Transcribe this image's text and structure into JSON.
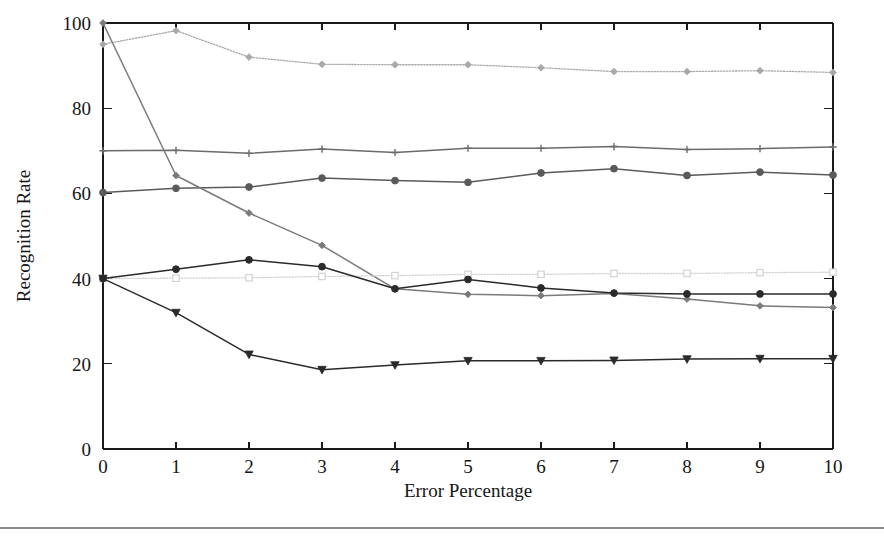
{
  "figure": {
    "background_color": "#ffffff",
    "footer_rule_color": "#8b8b8b"
  },
  "axes": {
    "x_title": "Error Percentage",
    "y_title": "Recognition Rate",
    "x_ticks": [
      "0",
      "1",
      "2",
      "3",
      "4",
      "5",
      "6",
      "7",
      "8",
      "9",
      "10"
    ],
    "y_ticks": [
      "0",
      "20",
      "40",
      "60",
      "80",
      "100"
    ]
  },
  "chart_data": {
    "type": "line",
    "title": "",
    "xlabel": "Error Percentage",
    "ylabel": "Recognition Rate",
    "xlim": [
      0,
      10
    ],
    "ylim": [
      0,
      100
    ],
    "x": [
      0,
      1,
      2,
      3,
      4,
      5,
      6,
      7,
      8,
      9,
      10
    ],
    "grid": false,
    "legend_position": "none",
    "series": [
      {
        "name": "series-top-dotted-diamond",
        "marker": "diamond",
        "color": "#a8a8a8",
        "linestyle": "dotted",
        "values": [
          95.0,
          98.2,
          92.0,
          90.3,
          90.2,
          90.2,
          89.5,
          88.6,
          88.6,
          88.8,
          88.4
        ]
      },
      {
        "name": "series-flat-70-plus",
        "marker": "plus",
        "color": "#6b6b6b",
        "linestyle": "solid",
        "values": [
          70.0,
          70.1,
          69.4,
          70.4,
          69.6,
          70.6,
          70.6,
          71.0,
          70.3,
          70.5,
          70.9
        ]
      },
      {
        "name": "series-rising-60-circle",
        "marker": "circle",
        "color": "#5a5a5a",
        "linestyle": "solid",
        "values": [
          60.2,
          61.2,
          61.5,
          63.6,
          63.0,
          62.6,
          64.8,
          65.8,
          64.2,
          65.0,
          64.3
        ]
      },
      {
        "name": "series-steep-decline-diamond",
        "marker": "diamond",
        "color": "#7a7a7a",
        "linestyle": "solid",
        "values": [
          100.0,
          64.2,
          55.4,
          47.8,
          37.6,
          36.3,
          36.0,
          36.5,
          35.2,
          33.6,
          33.2
        ]
      },
      {
        "name": "series-flat-40-square",
        "marker": "square",
        "color": "#d2d2d2",
        "linestyle": "dotted",
        "values": [
          40.0,
          40.1,
          40.2,
          40.5,
          40.7,
          41.0,
          41.0,
          41.2,
          41.2,
          41.4,
          41.5
        ]
      },
      {
        "name": "series-hump-circle",
        "marker": "circle",
        "color": "#2a2a2a",
        "linestyle": "solid",
        "values": [
          40.0,
          42.2,
          44.4,
          42.8,
          37.6,
          39.8,
          37.8,
          36.6,
          36.4,
          36.4,
          36.4
        ]
      },
      {
        "name": "series-low-triangle",
        "marker": "triangle-down",
        "color": "#2a2a2a",
        "linestyle": "solid",
        "values": [
          40.0,
          32.0,
          22.2,
          18.6,
          19.7,
          20.7,
          20.7,
          20.8,
          21.1,
          21.2,
          21.2
        ]
      }
    ]
  }
}
